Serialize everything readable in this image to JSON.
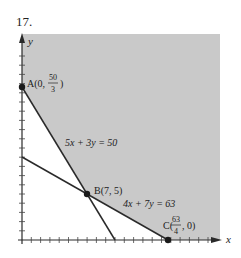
{
  "problem_number": "17.",
  "colors": {
    "shade": "#c9c9c9",
    "line": "#2a2a2a",
    "text": "#222222",
    "background": "#ffffff"
  },
  "axes": {
    "x_label": "x",
    "y_label": "y",
    "x_ticks": 20,
    "y_ticks": 20
  },
  "lines": [
    {
      "equation": "5x + 3y = 50",
      "label": "5x + 3y = 50"
    },
    {
      "equation": "4x + 7y = 63",
      "label": "4x + 7y = 63"
    }
  ],
  "points": {
    "A": {
      "label": "A(0,",
      "num": "50",
      "den": "3",
      "close": ")",
      "x": 0,
      "y": 16.667
    },
    "B": {
      "label": "B(7, 5)",
      "x": 7,
      "y": 5
    },
    "C": {
      "label": "C(",
      "num": "63",
      "den": "4",
      "close": ", 0)",
      "x": 15.75,
      "y": 0
    }
  },
  "region": "feasible region above both lines, shaded"
}
